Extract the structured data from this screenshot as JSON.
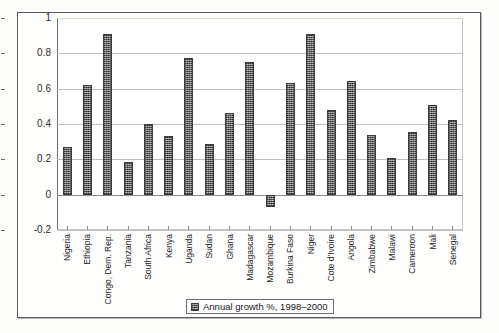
{
  "chart_data": {
    "type": "bar",
    "title": "",
    "subtitle": "",
    "xlabel": "",
    "ylabel": "",
    "ylim": [
      -0.2,
      1
    ],
    "ytick_labels": [
      "1",
      "0.8",
      "0.6",
      "0.4",
      "0.2",
      "0",
      "-0.2"
    ],
    "ytick_values": [
      1,
      0.8,
      0.6,
      0.4,
      0.2,
      0,
      -0.2
    ],
    "grid": true,
    "legend_position": "bottom-center",
    "legend": [
      "Annual growth %, 1998–2000"
    ],
    "series_name": "Annual growth %, 1998–2000",
    "bar_color": "#7d7d7d",
    "bar_border_color": "#3b3b3b",
    "categories": [
      "Nigeria",
      "Ethiopia",
      "Congo, Dem. Rep.",
      "Tanzania",
      "South Africa",
      "Kenya",
      "Uganda",
      "Sudan",
      "Ghana",
      "Madagascar",
      "Mozambique",
      "Burkina Faso",
      "Niger",
      "Cote d'Ivoire",
      "Angola",
      "Zimbabwe",
      "Malawi",
      "Cameroon",
      "Mali",
      "Senegal"
    ],
    "values": [
      0.27,
      0.62,
      0.91,
      0.185,
      0.4,
      0.33,
      0.775,
      0.285,
      0.465,
      0.75,
      -0.07,
      0.63,
      0.91,
      0.48,
      0.645,
      0.34,
      0.21,
      0.355,
      0.51,
      0.425
    ]
  }
}
